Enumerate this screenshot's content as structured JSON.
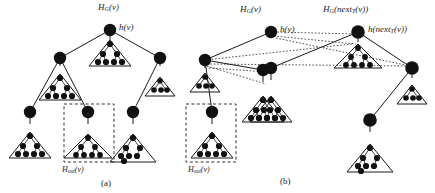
{
  "figure": {
    "title_alt": "",
    "background": "#ffffff",
    "ink": "#111111",
    "node_fill": "#111111",
    "panels": [
      {
        "id": "a",
        "caption": "(a)"
      },
      {
        "id": "b",
        "caption": "(b)"
      }
    ]
  },
  "labels": {
    "a_top_set": {
      "base": "H",
      "sub": "G",
      "arg": "(v)"
    },
    "a_root_node": {
      "base": "h",
      "arg": "(v)"
    },
    "a_out_box": {
      "base": "H",
      "sub": "out",
      "arg": "(v)"
    },
    "b_left_set": {
      "base": "H",
      "sub": "G",
      "arg": "(v)"
    },
    "b_left_root": {
      "base": "h",
      "arg": "(v)"
    },
    "b_right_set": {
      "base": "H",
      "sub": "G",
      "arg_pre": "(next",
      "arg_sub": "T",
      "arg_post": "(v))"
    },
    "b_right_root": {
      "base": "h",
      "arg_pre": "(next",
      "arg_sub": "T",
      "arg_post": "(v))"
    },
    "b_out_box": {
      "base": "H",
      "sub": "out",
      "arg": "(v)"
    }
  },
  "text": {
    "a_top_set_full": "H_G(v)",
    "a_root_node_full": "h(v)",
    "a_out_box_full": "H_out(v)",
    "b_right_set_full": "H_G(next_T(v))",
    "b_right_root_full": "h(next_T(v))",
    "caption_a": "(a)",
    "caption_b": "(b)"
  },
  "colors": {
    "stroke": "#1a1a1a",
    "node": "#111111",
    "dashed_box": "#333333",
    "dotted_edge": "#222222"
  }
}
